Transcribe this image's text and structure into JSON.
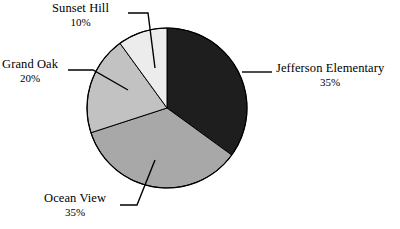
{
  "chart_data": {
    "type": "pie",
    "title": "",
    "legend_position": "callout-labels",
    "categories": [
      "Jefferson Elementary",
      "Ocean View",
      "Grand Oak",
      "Sunset Hill"
    ],
    "values": [
      35,
      35,
      20,
      10
    ],
    "value_unit": "%",
    "labels": [
      {
        "name": "Jefferson Elementary",
        "pct": "35%",
        "value": 35,
        "color": "#1e1e1e",
        "start_angle_deg": 0,
        "end_angle_deg": 126
      },
      {
        "name": "Ocean View",
        "pct": "35%",
        "value": 35,
        "color": "#a8a8a8",
        "start_angle_deg": 126,
        "end_angle_deg": 252
      },
      {
        "name": "Grand Oak",
        "pct": "20%",
        "value": 20,
        "color": "#c2c2c2",
        "start_angle_deg": 252,
        "end_angle_deg": 324
      },
      {
        "name": "Sunset Hill",
        "pct": "10%",
        "value": 10,
        "color": "#ececec",
        "start_angle_deg": 324,
        "end_angle_deg": 360
      }
    ],
    "background_color": "#ffffff",
    "outline_color": "#000000",
    "text_color": "#000000"
  },
  "callouts": {
    "jefferson": {
      "name": "Jefferson Elementary",
      "pct": "35%"
    },
    "oceanview": {
      "name": "Ocean View",
      "pct": "35%"
    },
    "grandoak": {
      "name": "Grand Oak",
      "pct": "20%"
    },
    "sunsethill": {
      "name": "Sunset Hill",
      "pct": "10%"
    }
  }
}
